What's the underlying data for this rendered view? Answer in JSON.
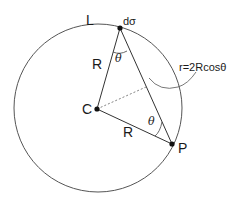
{
  "diagram": {
    "labels": {
      "L": "L",
      "dsigma": "dσ",
      "R_upper": "R",
      "theta_upper": "θ",
      "formula": "r=2Rcosθ",
      "C": "C",
      "theta_lower": "θ",
      "R_lower": "R",
      "P": "P"
    },
    "colors": {
      "stroke": "#333333",
      "circle": "#555555",
      "dashed": "#777777"
    }
  }
}
